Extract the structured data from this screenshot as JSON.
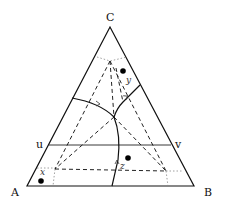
{
  "diagram": {
    "type": "ternary phase diagram",
    "vertices": {
      "top": "C",
      "left": "A",
      "right": "B"
    },
    "isotherm_labels": {
      "left": "u",
      "right": "v"
    },
    "points": [
      {
        "label": "y",
        "position": "upper region near C"
      },
      {
        "label": "x",
        "position": "lower-left near A"
      },
      {
        "label": "z",
        "position": "lower-center"
      }
    ],
    "colors": {
      "line": "#111111",
      "dotted": "#888888",
      "background": "#ffffff"
    }
  }
}
